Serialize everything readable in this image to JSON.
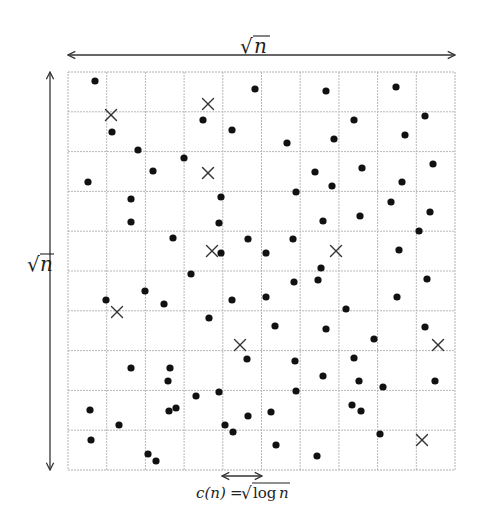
{
  "diagram": {
    "grid": {
      "x0": 68,
      "y0": 72,
      "x1": 455,
      "y1": 470,
      "cols": 10,
      "rows": 10,
      "line_color": "#b8b8b8"
    },
    "labels": {
      "top_dimension": {
        "radical": "√",
        "symbol": "n"
      },
      "left_dimension": {
        "radical": "√",
        "symbol": "n"
      },
      "cell_size": {
        "lhs": "c(n)",
        "equals": "=",
        "radical": "√",
        "rhs_func": "log",
        "rhs_var": "n"
      }
    },
    "arrows": {
      "top": {
        "x0": 68,
        "x1": 455,
        "y": 55
      },
      "left": {
        "x": 50,
        "y0": 72,
        "y1": 470
      },
      "cell": {
        "x0": 222,
        "x1": 262,
        "y": 476
      }
    },
    "colors": {
      "dot": "#111111",
      "cross": "#333333",
      "arrow": "#333333",
      "background": "#ffffff"
    },
    "dots": [
      [
        95,
        81
      ],
      [
        255,
        89
      ],
      [
        326,
        91
      ],
      [
        396,
        87
      ],
      [
        112,
        132
      ],
      [
        203,
        120
      ],
      [
        232,
        130
      ],
      [
        354,
        120
      ],
      [
        425,
        116
      ],
      [
        287,
        143
      ],
      [
        334,
        139
      ],
      [
        405,
        135
      ],
      [
        138,
        150
      ],
      [
        184,
        158
      ],
      [
        153,
        171
      ],
      [
        88,
        182
      ],
      [
        315,
        172
      ],
      [
        362,
        168
      ],
      [
        433,
        164
      ],
      [
        402,
        182
      ],
      [
        332,
        186
      ],
      [
        296,
        192
      ],
      [
        131,
        199
      ],
      [
        221,
        197
      ],
      [
        391,
        202
      ],
      [
        430,
        212
      ],
      [
        131,
        222
      ],
      [
        219,
        223
      ],
      [
        323,
        221
      ],
      [
        360,
        216
      ],
      [
        419,
        231
      ],
      [
        173,
        238
      ],
      [
        248,
        239
      ],
      [
        293,
        239
      ],
      [
        221,
        253
      ],
      [
        266,
        253
      ],
      [
        399,
        250
      ],
      [
        191,
        274
      ],
      [
        321,
        268
      ],
      [
        294,
        282
      ],
      [
        318,
        280
      ],
      [
        427,
        279
      ],
      [
        145,
        291
      ],
      [
        106,
        300
      ],
      [
        164,
        304
      ],
      [
        232,
        300
      ],
      [
        266,
        297
      ],
      [
        397,
        297
      ],
      [
        209,
        318
      ],
      [
        346,
        309
      ],
      [
        275,
        326
      ],
      [
        326,
        329
      ],
      [
        425,
        327
      ],
      [
        374,
        339
      ],
      [
        247,
        359
      ],
      [
        295,
        361
      ],
      [
        354,
        358
      ],
      [
        131,
        368
      ],
      [
        170,
        368
      ],
      [
        168,
        381
      ],
      [
        323,
        376
      ],
      [
        359,
        381
      ],
      [
        383,
        387
      ],
      [
        435,
        381
      ],
      [
        196,
        396
      ],
      [
        219,
        392
      ],
      [
        296,
        391
      ],
      [
        90,
        410
      ],
      [
        169,
        411
      ],
      [
        176,
        408
      ],
      [
        248,
        416
      ],
      [
        271,
        412
      ],
      [
        352,
        405
      ],
      [
        361,
        411
      ],
      [
        119,
        425
      ],
      [
        225,
        425
      ],
      [
        233,
        432
      ],
      [
        91,
        440
      ],
      [
        276,
        445
      ],
      [
        380,
        434
      ],
      [
        148,
        454
      ],
      [
        156,
        461
      ],
      [
        317,
        456
      ]
    ],
    "crosses": [
      [
        111,
        115
      ],
      [
        208,
        104
      ],
      [
        208,
        173
      ],
      [
        212,
        251
      ],
      [
        336,
        251
      ],
      [
        117,
        312
      ],
      [
        240,
        345
      ],
      [
        438,
        345
      ],
      [
        422,
        440
      ]
    ],
    "dot_radius": 3.6,
    "cross_half_size": 5.5
  }
}
